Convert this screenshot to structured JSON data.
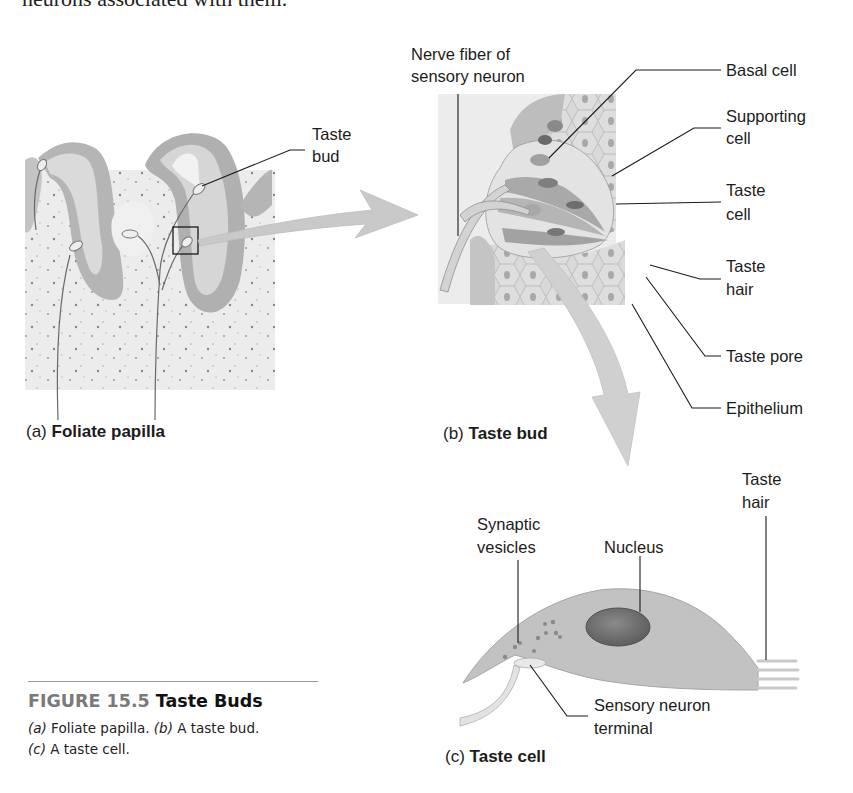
{
  "body_text_fragment": "neurons associated with them.",
  "panel_a": {
    "caption_letter": "(a)",
    "caption_title": "Foliate papilla",
    "labels": {
      "taste_bud_line1": "Taste",
      "taste_bud_line2": "bud"
    }
  },
  "panel_b": {
    "caption_letter": "(b)",
    "caption_title": "Taste bud",
    "labels": {
      "nerve_fiber_line1": "Nerve fiber of",
      "nerve_fiber_line2": "sensory neuron",
      "basal_cell": "Basal cell",
      "supporting_cell_line1": "Supporting",
      "supporting_cell_line2": "cell",
      "taste_cell_line1": "Taste",
      "taste_cell_line2": "cell",
      "taste_hair_line1": "Taste",
      "taste_hair_line2": "hair",
      "taste_pore": "Taste pore",
      "epithelium": "Epithelium"
    }
  },
  "panel_c": {
    "caption_letter": "(c)",
    "caption_title": "Taste cell",
    "labels": {
      "taste_hair_line1": "Taste",
      "taste_hair_line2": "hair",
      "synaptic_vesicles_line1": "Synaptic",
      "synaptic_vesicles_line2": "vesicles",
      "nucleus": "Nucleus",
      "sensory_terminal_line1": "Sensory neuron",
      "sensory_terminal_line2": "terminal"
    }
  },
  "figure": {
    "number": "FIGURE 15.5",
    "title": "Taste Buds",
    "desc_a_letter": "(a)",
    "desc_a_text": " Foliate papilla. ",
    "desc_b_letter": "(b)",
    "desc_b_text": " A taste bud.",
    "desc_c_letter": "(c)",
    "desc_c_text": " A taste cell."
  }
}
